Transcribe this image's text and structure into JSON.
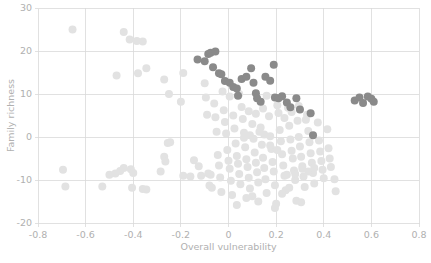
{
  "chart_data": {
    "type": "scatter",
    "title": "",
    "xlabel": "Overall vulnerability",
    "ylabel": "Family richness",
    "xlim": [
      -0.8,
      0.8
    ],
    "ylim": [
      -20,
      30
    ],
    "xticks": [
      -0.8,
      -0.6,
      -0.4,
      -0.2,
      0,
      0.2,
      0.4,
      0.6,
      0.8
    ],
    "xticklabels": [
      "-0.8",
      "-0.6",
      "-0.4",
      "-0.2",
      "0",
      "0.2",
      "0.4",
      "0.6",
      "0.8"
    ],
    "yticks": [
      -20,
      -10,
      0,
      10,
      20,
      30
    ],
    "yticklabels": [
      "-20",
      "-10",
      "0",
      "10",
      "20",
      "30"
    ],
    "grid": true,
    "legend": "none",
    "marker_radius": 4.0,
    "colors": {
      "significant": "#8a8a8a",
      "nonsignificant": "#e2e2e2",
      "grid": "#d9d9d9",
      "text": "#b0b0b0",
      "background": "#ffffff"
    },
    "series": [
      {
        "name": "significant",
        "color": "#8a8a8a",
        "points": [
          [
            -0.13,
            18.0
          ],
          [
            -0.1,
            17.6
          ],
          [
            -0.085,
            19.3
          ],
          [
            -0.075,
            19.6
          ],
          [
            -0.065,
            16.2
          ],
          [
            -0.055,
            19.9
          ],
          [
            -0.04,
            14.8
          ],
          [
            -0.03,
            14.6
          ],
          [
            -0.015,
            13.0
          ],
          [
            0.005,
            12.6
          ],
          [
            0.02,
            11.6
          ],
          [
            0.035,
            11.3
          ],
          [
            0.04,
            9.6
          ],
          [
            0.055,
            13.5
          ],
          [
            0.075,
            14.0
          ],
          [
            0.095,
            16.0
          ],
          [
            0.105,
            12.6
          ],
          [
            0.115,
            10.2
          ],
          [
            0.12,
            9.0
          ],
          [
            0.135,
            8.2
          ],
          [
            0.155,
            14.0
          ],
          [
            0.175,
            13.1
          ],
          [
            0.19,
            16.8
          ],
          [
            0.195,
            9.2
          ],
          [
            0.21,
            9.0
          ],
          [
            0.225,
            9.5
          ],
          [
            0.245,
            8.0
          ],
          [
            0.26,
            6.9
          ],
          [
            0.285,
            9.0
          ],
          [
            0.3,
            6.4
          ],
          [
            0.345,
            5.5
          ],
          [
            0.355,
            0.4
          ],
          [
            0.53,
            8.5
          ],
          [
            0.55,
            9.2
          ],
          [
            0.565,
            7.9
          ],
          [
            0.585,
            9.4
          ],
          [
            0.6,
            8.9
          ],
          [
            0.61,
            8.2
          ]
        ]
      },
      {
        "name": "nonsignificant",
        "color": "#e2e2e2",
        "points": [
          [
            -0.655,
            25.0
          ],
          [
            -0.695,
            -7.6
          ],
          [
            -0.685,
            -11.5
          ],
          [
            -0.44,
            24.4
          ],
          [
            -0.415,
            22.7
          ],
          [
            -0.385,
            22.3
          ],
          [
            -0.36,
            22.2
          ],
          [
            -0.47,
            14.3
          ],
          [
            -0.38,
            14.8
          ],
          [
            -0.345,
            16.0
          ],
          [
            -0.53,
            -11.5
          ],
          [
            -0.5,
            -8.8
          ],
          [
            -0.475,
            -8.5
          ],
          [
            -0.455,
            -7.9
          ],
          [
            -0.44,
            -7.2
          ],
          [
            -0.41,
            -7.5
          ],
          [
            -0.4,
            -8.4
          ],
          [
            -0.405,
            -11.8
          ],
          [
            -0.36,
            -12.1
          ],
          [
            -0.345,
            -12.2
          ],
          [
            -0.27,
            13.4
          ],
          [
            -0.25,
            10.0
          ],
          [
            -0.255,
            -1.4
          ],
          [
            -0.245,
            -1.2
          ],
          [
            -0.27,
            -4.6
          ],
          [
            -0.265,
            -5.7
          ],
          [
            -0.285,
            -8.0
          ],
          [
            -0.19,
            14.9
          ],
          [
            -0.2,
            8.2
          ],
          [
            -0.19,
            -9.0
          ],
          [
            -0.16,
            -9.2
          ],
          [
            -0.145,
            -5.4
          ],
          [
            -0.125,
            -6.8
          ],
          [
            -0.115,
            -9.0
          ],
          [
            -0.1,
            12.5
          ],
          [
            -0.095,
            9.2
          ],
          [
            -0.09,
            5.2
          ],
          [
            -0.085,
            -8.5
          ],
          [
            -0.075,
            -8.8
          ],
          [
            -0.08,
            -11.3
          ],
          [
            -0.07,
            -11.8
          ],
          [
            -0.06,
            7.8
          ],
          [
            -0.055,
            4.6
          ],
          [
            -0.05,
            1.2
          ],
          [
            -0.045,
            -4.2
          ],
          [
            -0.04,
            -6.6
          ],
          [
            -0.035,
            -9.4
          ],
          [
            -0.03,
            -12.8
          ],
          [
            -0.02,
            6.2
          ],
          [
            -0.015,
            3.5
          ],
          [
            -0.01,
            0.8
          ],
          [
            -0.005,
            -3.0
          ],
          [
            0.0,
            -5.5
          ],
          [
            0.005,
            -7.4
          ],
          [
            0.01,
            -10.2
          ],
          [
            0.015,
            -13.5
          ],
          [
            0.02,
            5.0
          ],
          [
            0.025,
            2.0
          ],
          [
            0.03,
            -1.5
          ],
          [
            0.035,
            -4.4
          ],
          [
            0.04,
            -6.2
          ],
          [
            0.045,
            -8.6
          ],
          [
            0.05,
            -11.0
          ],
          [
            0.06,
            4.2
          ],
          [
            0.065,
            1.0
          ],
          [
            0.07,
            -2.4
          ],
          [
            0.075,
            -5.2
          ],
          [
            0.08,
            -7.0
          ],
          [
            0.085,
            -9.5
          ],
          [
            0.09,
            -12.0
          ],
          [
            0.1,
            3.0
          ],
          [
            0.105,
            -0.4
          ],
          [
            0.11,
            -3.6
          ],
          [
            0.115,
            -6.0
          ],
          [
            0.12,
            -8.2
          ],
          [
            0.125,
            -10.6
          ],
          [
            0.135,
            2.2
          ],
          [
            0.14,
            -1.8
          ],
          [
            0.145,
            -4.8
          ],
          [
            0.15,
            -7.2
          ],
          [
            0.155,
            -9.8
          ],
          [
            0.16,
            -13.0
          ],
          [
            0.17,
            4.8
          ],
          [
            0.175,
            0.2
          ],
          [
            0.18,
            -2.8
          ],
          [
            0.185,
            -5.8
          ],
          [
            0.19,
            -8.0
          ],
          [
            0.195,
            -11.2
          ],
          [
            0.2,
            -15.5
          ],
          [
            0.21,
            5.6
          ],
          [
            0.215,
            1.6
          ],
          [
            0.22,
            -1.0
          ],
          [
            0.225,
            -4.0
          ],
          [
            0.23,
            -6.6
          ],
          [
            0.235,
            -9.0
          ],
          [
            0.24,
            -12.4
          ],
          [
            0.25,
            6.8
          ],
          [
            0.255,
            2.6
          ],
          [
            0.26,
            -0.6
          ],
          [
            0.265,
            -3.2
          ],
          [
            0.27,
            -5.0
          ],
          [
            0.275,
            -7.8
          ],
          [
            0.28,
            -10.0
          ],
          [
            0.29,
            3.8
          ],
          [
            0.295,
            0.0
          ],
          [
            0.3,
            -2.2
          ],
          [
            0.305,
            -4.6
          ],
          [
            0.31,
            -6.8
          ],
          [
            0.315,
            -9.2
          ],
          [
            0.32,
            -11.6
          ],
          [
            0.33,
            5.2
          ],
          [
            0.335,
            1.4
          ],
          [
            0.34,
            -1.2
          ],
          [
            0.345,
            -3.8
          ],
          [
            0.35,
            -6.0
          ],
          [
            0.355,
            -8.4
          ],
          [
            0.36,
            -10.8
          ],
          [
            0.375,
            3.4
          ],
          [
            0.38,
            -0.8
          ],
          [
            0.385,
            -3.4
          ],
          [
            0.39,
            -5.6
          ],
          [
            0.395,
            -7.6
          ],
          [
            0.4,
            -9.6
          ],
          [
            0.415,
            1.8
          ],
          [
            0.42,
            -2.6
          ],
          [
            0.425,
            -5.0
          ],
          [
            0.43,
            -7.0
          ],
          [
            0.445,
            -9.8
          ],
          [
            0.45,
            -12.6
          ],
          [
            0.285,
            -14.8
          ],
          [
            0.305,
            -15.2
          ],
          [
            0.195,
            -16.5
          ],
          [
            0.125,
            -15.0
          ],
          [
            0.075,
            -14.2
          ],
          [
            0.035,
            -15.8
          ],
          [
            0.175,
            -2.0
          ],
          [
            0.205,
            -3.0
          ],
          [
            0.245,
            -8.8
          ],
          [
            0.28,
            -8.6
          ],
          [
            0.31,
            -7.4
          ],
          [
            0.335,
            -8.0
          ],
          [
            0.36,
            -7.2
          ],
          [
            0.055,
            7.0
          ],
          [
            0.085,
            6.0
          ],
          [
            0.115,
            5.4
          ],
          [
            0.145,
            6.6
          ],
          [
            0.205,
            7.4
          ],
          [
            0.235,
            4.4
          ],
          [
            0.265,
            5.8
          ],
          [
            0.295,
            7.2
          ],
          [
            0.325,
            4.0
          ],
          [
            0.15,
            0.6
          ],
          [
            0.09,
            0.4
          ],
          [
            0.065,
            -0.2
          ],
          [
            0.005,
            9.4
          ],
          [
            -0.025,
            10.6
          ],
          [
            0.045,
            10.0
          ],
          [
            0.16,
            9.6
          ],
          [
            0.13,
            1.2
          ],
          [
            0.1,
            -13.8
          ],
          [
            0.225,
            -13.2
          ],
          [
            0.255,
            -11.8
          ]
        ]
      }
    ]
  },
  "axes": {
    "x_title": "Overall vulnerability",
    "y_title": "Family richness"
  }
}
